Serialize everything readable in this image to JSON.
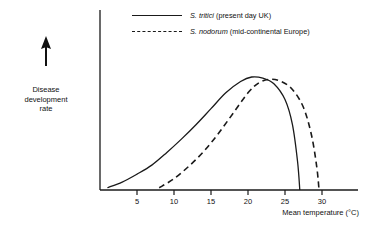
{
  "figure": {
    "y_axis_caption_lines": [
      "Disease",
      "development",
      "rate"
    ],
    "y_axis_arrow_icon": "up-arrow-icon",
    "x_axis_title": "Mean temperature (°C)"
  },
  "legend": {
    "position": "top-center",
    "entries": [
      {
        "style": "solid",
        "name_italic": "S. tritici",
        "name_rest": " (present day UK)"
      },
      {
        "style": "dashed",
        "name_italic": "S. nodorum",
        "name_rest": " (mid-continental Europe)"
      }
    ]
  },
  "chart_data": {
    "type": "line",
    "title": "",
    "xlabel": "Mean temperature (°C)",
    "ylabel": "Disease development rate",
    "xlim": [
      0,
      33
    ],
    "ylim": [
      0,
      1.12
    ],
    "grid": false,
    "legend_position": "top-center",
    "xticks": [
      5,
      10,
      15,
      20,
      25,
      30
    ],
    "xtick_labels": [
      "5",
      "10",
      "15",
      "20",
      "25",
      "30"
    ],
    "yticks": [],
    "ytick_labels": [],
    "series": [
      {
        "name": "S. tritici (present day UK)",
        "style": "solid",
        "color": "#1a1a1a",
        "x": [
          1,
          3,
          5,
          7,
          9,
          11,
          13,
          15,
          17,
          19,
          20.5,
          22,
          23.5,
          25,
          26,
          26.7,
          27
        ],
        "y": [
          0.02,
          0.07,
          0.14,
          0.22,
          0.33,
          0.45,
          0.58,
          0.72,
          0.86,
          0.96,
          1.0,
          0.99,
          0.94,
          0.8,
          0.58,
          0.25,
          0.0
        ]
      },
      {
        "name": "S. nodorum (mid-continental Europe)",
        "style": "dashed",
        "color": "#1a1a1a",
        "x": [
          8,
          10,
          12,
          14,
          16,
          18,
          20,
          21.5,
          23,
          24.5,
          26,
          27.5,
          28.6,
          29.3,
          29.6
        ],
        "y": [
          0.02,
          0.1,
          0.21,
          0.34,
          0.5,
          0.68,
          0.86,
          0.95,
          0.98,
          0.96,
          0.89,
          0.73,
          0.48,
          0.2,
          0.0
        ]
      }
    ]
  },
  "colors": {
    "ink": "#1a1a1a",
    "background": "#ffffff"
  }
}
